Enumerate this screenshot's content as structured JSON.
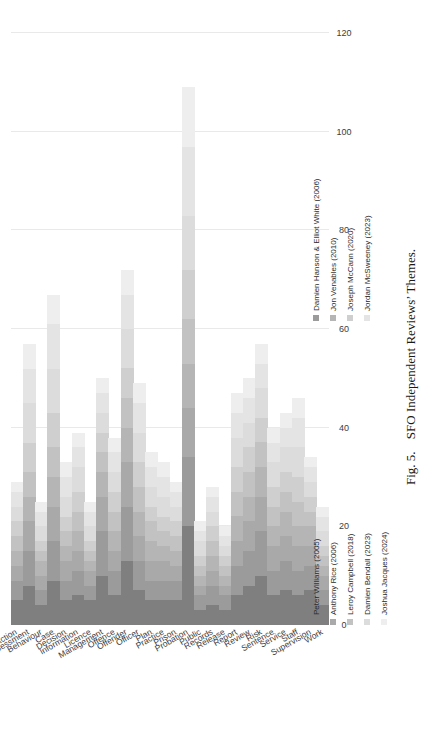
{
  "figure": {
    "number": "Fig. 5.",
    "title": "SFO Independent Reviews’ Themes."
  },
  "legend": {
    "position": "bottom",
    "items": [
      {
        "label": "Peter Williams (2005)",
        "color": "#7f7f7f"
      },
      {
        "label": "Damien Hanson & Elliot White (2006)",
        "color": "#9b9b9b"
      },
      {
        "label": "Anthony Rice (2006)",
        "color": "#a9a9a9"
      },
      {
        "label": "Jon Venables (2010)",
        "color": "#b5b5b5"
      },
      {
        "label": "Leroy Campbell (2018)",
        "color": "#c2c2c2"
      },
      {
        "label": "Joseph McCann (2020)",
        "color": "#cfcfcf"
      },
      {
        "label": "Damien Bendall (2023)",
        "color": "#dcdcdc"
      },
      {
        "label": "Jordan McSweeney (2023)",
        "color": "#e4e4e4"
      },
      {
        "label": "Joshua Jacques (2024)",
        "color": "#eeeeee"
      }
    ]
  },
  "chart_data": {
    "type": "bar",
    "orientation": "horizontal",
    "stacked": true,
    "title": "SFO Independent Reviews’ Themes.",
    "xlabel": "",
    "ylabel": "",
    "xlim": [
      0,
      120
    ],
    "xticks": [
      0,
      20,
      40,
      60,
      80,
      100,
      120
    ],
    "xtick_labels": [
      "0",
      "20",
      "40",
      "60",
      "80",
      "100",
      "120"
    ],
    "grid": true,
    "categories": [
      "Action",
      "Assessment",
      "Behaviour",
      "Case",
      "Decision",
      "Information",
      "Licence",
      "Management",
      "Offence",
      "Offender",
      "Officer",
      "Plan",
      "Practice",
      "Prison",
      "Probation",
      "Public",
      "Records",
      "Release",
      "Report",
      "Review",
      "Risk",
      "Sentence",
      "Service",
      "Staff",
      "Supervision",
      "Work"
    ],
    "series": [
      {
        "name": "Peter Williams (2005)",
        "color": "#7f7f7f",
        "values": [
          5,
          8,
          4,
          9,
          5,
          6,
          5,
          10,
          6,
          13,
          7,
          5,
          5,
          5,
          20,
          3,
          4,
          3,
          6,
          8,
          10,
          6,
          7,
          6,
          7,
          4
        ]
      },
      {
        "name": "Damien Hanson & Elliot White (2006)",
        "color": "#9b9b9b",
        "values": [
          4,
          7,
          3,
          8,
          4,
          5,
          3,
          9,
          5,
          11,
          6,
          4,
          4,
          4,
          14,
          3,
          4,
          3,
          6,
          7,
          9,
          5,
          6,
          5,
          5,
          3
        ]
      },
      {
        "name": "Anthony Rice (2006)",
        "color": "#a9a9a9",
        "values": [
          3,
          6,
          3,
          7,
          4,
          4,
          3,
          7,
          4,
          9,
          5,
          4,
          4,
          3,
          10,
          2,
          3,
          2,
          5,
          6,
          7,
          5,
          5,
          5,
          4,
          3
        ]
      },
      {
        "name": "Jon Venables (2010)",
        "color": "#b5b5b5",
        "values": [
          3,
          5,
          3,
          6,
          3,
          4,
          2,
          5,
          4,
          7,
          5,
          4,
          3,
          3,
          9,
          2,
          3,
          2,
          5,
          5,
          6,
          4,
          5,
          4,
          4,
          2
        ]
      },
      {
        "name": "Leroy Campbell (2018)",
        "color": "#c2c2c2",
        "values": [
          3,
          5,
          2,
          6,
          3,
          4,
          2,
          4,
          4,
          6,
          5,
          4,
          3,
          3,
          9,
          2,
          3,
          2,
          5,
          5,
          5,
          4,
          4,
          5,
          3,
          2
        ]
      },
      {
        "name": "Joseph McCann (2020)",
        "color": "#cfcfcf",
        "values": [
          3,
          6,
          2,
          7,
          3,
          4,
          2,
          4,
          4,
          6,
          5,
          3,
          3,
          3,
          10,
          2,
          3,
          2,
          5,
          5,
          5,
          4,
          4,
          5,
          3,
          2
        ]
      },
      {
        "name": "Damien Bendall (2023)",
        "color": "#dcdcdc",
        "values": [
          3,
          8,
          3,
          9,
          4,
          5,
          3,
          4,
          4,
          8,
          6,
          4,
          4,
          3,
          11,
          3,
          3,
          2,
          6,
          5,
          6,
          5,
          5,
          6,
          3,
          3
        ]
      },
      {
        "name": "Jordan McSweeney (2023)",
        "color": "#e4e4e4",
        "values": [
          3,
          7,
          3,
          9,
          4,
          4,
          3,
          4,
          4,
          7,
          6,
          4,
          4,
          3,
          14,
          2,
          3,
          2,
          5,
          5,
          5,
          4,
          4,
          6,
          3,
          3
        ]
      },
      {
        "name": "Joshua Jacques (2024)",
        "color": "#eeeeee",
        "values": [
          2,
          5,
          2,
          6,
          3,
          3,
          2,
          3,
          3,
          5,
          4,
          3,
          3,
          2,
          12,
          2,
          2,
          2,
          4,
          4,
          4,
          3,
          3,
          4,
          2,
          2
        ]
      }
    ],
    "totals": [
      29,
      57,
      25,
      67,
      33,
      39,
      25,
      50,
      38,
      72,
      49,
      35,
      33,
      29,
      109,
      21,
      28,
      20,
      47,
      50,
      57,
      40,
      43,
      46,
      34,
      24
    ]
  }
}
